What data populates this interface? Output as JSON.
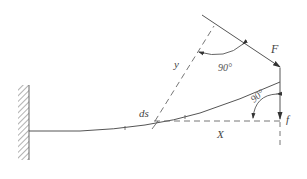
{
  "diagram": {
    "type": "cantilever-beam-deflection",
    "colors": {
      "line": "#555555",
      "dashed": "#666666",
      "hatch": "#666666",
      "text": "#444444",
      "background": "#ffffff"
    },
    "labels": {
      "force": "F",
      "element": "ds",
      "y_axis": "y",
      "x_axis": "X",
      "deflection": "f",
      "angle_top": "90°",
      "angle_right": "90°"
    },
    "elements": {
      "wall": "fixed-support-hatched-wall",
      "beam": "deflected-beam-curve",
      "force_arrow": "inclined-force-arrow",
      "deflection_arrow": "vertical-deflection-arrow",
      "x_reference": "horizontal-dashed-line",
      "y_reference": "inclined-dashed-line"
    }
  }
}
